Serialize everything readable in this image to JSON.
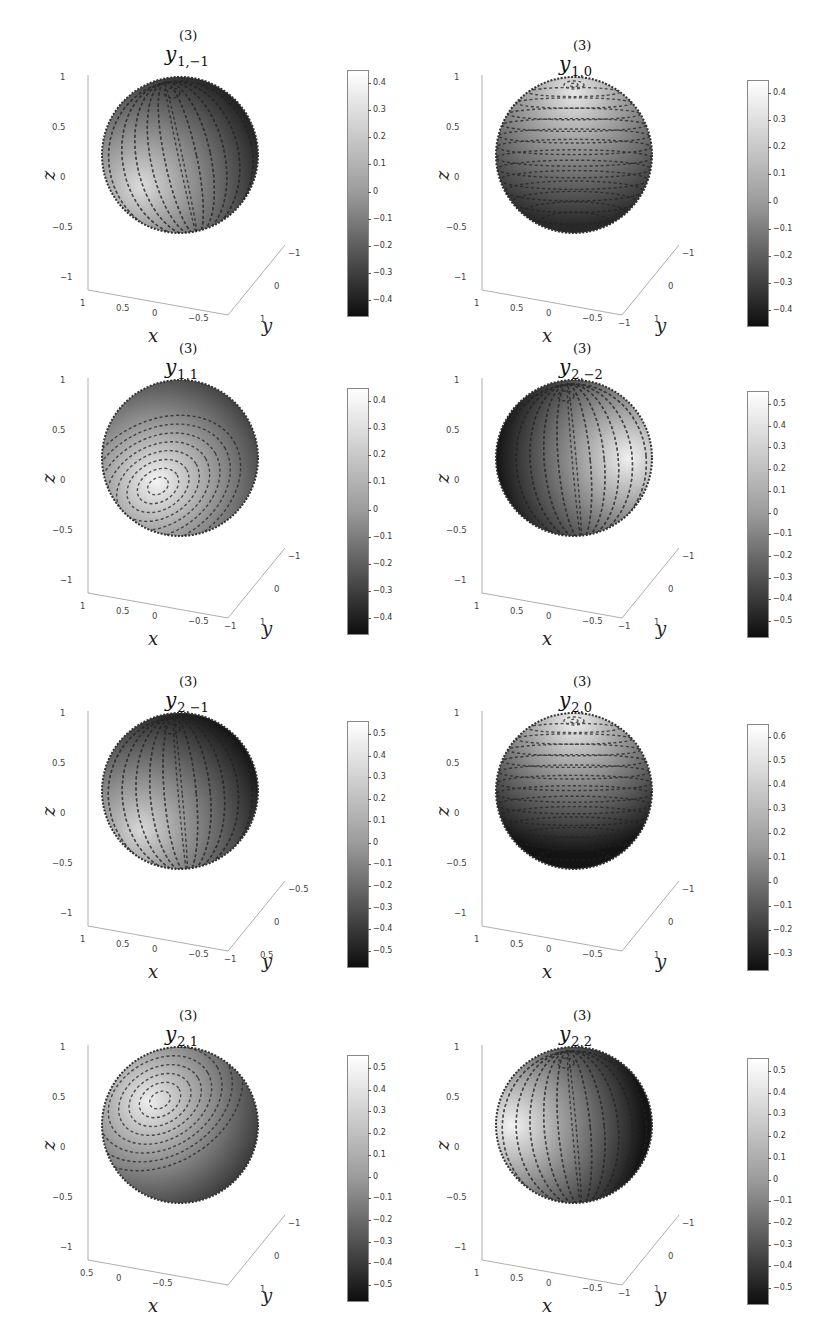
{
  "figure": {
    "superscript": "(3)",
    "symbol": "y",
    "axis_labels": {
      "x": "x",
      "y": "y",
      "z": "z"
    }
  },
  "chart_data": [
    {
      "type": "heatmap",
      "title": "y_{1,-1}^{(3)}",
      "subscript": "1,−1",
      "xlabel": "x",
      "ylabel": "y",
      "zlabel": "z",
      "z_ticks": [
        "1",
        "0.5",
        "0",
        "−0.5",
        "−1"
      ],
      "x_ticks": [
        "1",
        "0.5",
        "0",
        "−0.5"
      ],
      "y_ticks": [
        "−1",
        "0",
        "1"
      ],
      "colorbar": {
        "ticks": [
          "0.4",
          "0.3",
          "0.2",
          "0.1",
          "0",
          "−0.1",
          "−0.2",
          "−0.3",
          "−0.4"
        ],
        "range": [
          -0.48,
          0.48
        ]
      },
      "description": "sphere surface colored by field value with tangent vector field overlay; bright band lower-left, dark right half"
    },
    {
      "type": "heatmap",
      "title": "y_{1,0}^{(3)}",
      "subscript": "1,0",
      "xlabel": "x",
      "ylabel": "y",
      "zlabel": "z",
      "z_ticks": [
        "1",
        "0.5",
        "0",
        "−0.5",
        "−1"
      ],
      "x_ticks": [
        "1",
        "0.5",
        "0",
        "−0.5",
        "−1"
      ],
      "y_ticks": [
        "−1",
        "0",
        "1"
      ],
      "colorbar": {
        "ticks": [
          "0.4",
          "0.3",
          "0.2",
          "0.1",
          "0",
          "−0.1",
          "−0.2",
          "−0.3",
          "−0.4"
        ],
        "range": [
          -0.48,
          0.48
        ]
      },
      "description": "azimuthal circulating vector field, concentric circles at north pole; bright top, dark bottom"
    },
    {
      "type": "heatmap",
      "title": "y_{1,1}^{(3)}",
      "subscript": "1,1",
      "xlabel": "x",
      "ylabel": "y",
      "zlabel": "z",
      "z_ticks": [
        "1",
        "0.5",
        "0",
        "−0.5",
        "−1"
      ],
      "x_ticks": [
        "1",
        "0.5",
        "0",
        "−0.5",
        "−1"
      ],
      "y_ticks": [
        "−1",
        "0",
        "1"
      ],
      "colorbar": {
        "ticks": [
          "0.4",
          "0.3",
          "0.2",
          "0.1",
          "0",
          "−0.1",
          "−0.2",
          "−0.3",
          "−0.4"
        ],
        "range": [
          -0.48,
          0.48
        ]
      },
      "description": "vortex centered lower-left front; bright center, dark upper-right rim"
    },
    {
      "type": "heatmap",
      "title": "y_{2,-2}^{(3)}",
      "subscript": "2,−2",
      "xlabel": "x",
      "ylabel": "y",
      "zlabel": "z",
      "z_ticks": [
        "1",
        "0.5",
        "0",
        "−0.5",
        "−1"
      ],
      "x_ticks": [
        "1",
        "0.5",
        "0",
        "−0.5",
        "−1"
      ],
      "y_ticks": [
        "−1",
        "0",
        "1"
      ],
      "colorbar": {
        "ticks": [
          "0.5",
          "0.4",
          "0.3",
          "0.2",
          "0.1",
          "0",
          "−0.1",
          "−0.2",
          "−0.3",
          "−0.4",
          "−0.5"
        ],
        "range": [
          -0.55,
          0.55
        ]
      },
      "description": "dark lobe left-center, bright lobe right rim, meridional streamlines"
    },
    {
      "type": "heatmap",
      "title": "y_{2,-1}^{(3)}",
      "subscript": "2,−1",
      "xlabel": "x",
      "ylabel": "y",
      "zlabel": "z",
      "z_ticks": [
        "1",
        "0.5",
        "0",
        "−0.5",
        "−1"
      ],
      "x_ticks": [
        "1",
        "0.5",
        "0",
        "−0.5",
        "−1"
      ],
      "y_ticks": [
        "−0.5",
        "0",
        "0.5"
      ],
      "colorbar": {
        "ticks": [
          "0.5",
          "0.4",
          "0.3",
          "0.2",
          "0.1",
          "0",
          "−0.1",
          "−0.2",
          "−0.3",
          "−0.4",
          "−0.5"
        ],
        "range": [
          -0.55,
          0.55
        ]
      },
      "description": "dark upper-right lobe, bright lower-left, vortex near north pole"
    },
    {
      "type": "heatmap",
      "title": "y_{2,0}^{(3)}",
      "subscript": "2,0",
      "xlabel": "x",
      "ylabel": "y",
      "zlabel": "z",
      "z_ticks": [
        "1",
        "0.5",
        "0",
        "−0.5",
        "−1"
      ],
      "x_ticks": [
        "1",
        "0.5",
        "0",
        "−0.5"
      ],
      "y_ticks": [
        "−1",
        "0",
        "1"
      ],
      "colorbar": {
        "ticks": [
          "0.6",
          "0.5",
          "0.4",
          "0.3",
          "0.2",
          "0.1",
          "0",
          "−0.1",
          "−0.2",
          "−0.3"
        ],
        "range": [
          -0.32,
          0.63
        ]
      },
      "description": "concentric circles at north pole, bright cap, dark equatorial band"
    },
    {
      "type": "heatmap",
      "title": "y_{2,1}^{(3)}",
      "subscript": "2,1",
      "xlabel": "x",
      "ylabel": "y",
      "zlabel": "z",
      "z_ticks": [
        "1",
        "0.5",
        "0",
        "−0.5",
        "−1"
      ],
      "x_ticks": [
        "0.5",
        "0",
        "−0.5"
      ],
      "y_ticks": [
        "−1",
        "0",
        "1"
      ],
      "colorbar": {
        "ticks": [
          "0.5",
          "0.4",
          "0.3",
          "0.2",
          "0.1",
          "0",
          "−0.1",
          "−0.2",
          "−0.3",
          "−0.4",
          "−0.5"
        ],
        "range": [
          -0.55,
          0.55
        ]
      },
      "description": "bright vortex upper-left front, dark top and bottom"
    },
    {
      "type": "heatmap",
      "title": "y_{2,2}^{(3)}",
      "subscript": "2,2",
      "xlabel": "x",
      "ylabel": "y",
      "zlabel": "z",
      "z_ticks": [
        "1",
        "0.5",
        "0",
        "−0.5",
        "−1"
      ],
      "x_ticks": [
        "1",
        "0.5",
        "0",
        "−0.5",
        "−1"
      ],
      "y_ticks": [
        "−1",
        "0",
        "1"
      ],
      "colorbar": {
        "ticks": [
          "0.5",
          "0.4",
          "0.3",
          "0.2",
          "0.1",
          "0",
          "−0.1",
          "−0.2",
          "−0.3",
          "−0.4",
          "−0.5"
        ],
        "range": [
          -0.55,
          0.55
        ]
      },
      "description": "bright left rim lobe, dark right-center lobe, vortex near north pole"
    }
  ],
  "panels": [
    {
      "sub": "1,−1",
      "z": [
        "1",
        "0.5",
        "0",
        "−0.5",
        "−1"
      ],
      "x": [
        "1",
        "0.5",
        "0",
        "−0.5"
      ],
      "y": [
        "−1",
        "0",
        "1"
      ],
      "cb": [
        "0.4",
        "0.3",
        "0.2",
        "0.1",
        "0",
        "−0.1",
        "−0.2",
        "−0.3",
        "−0.4"
      ]
    },
    {
      "sub": "1,0",
      "z": [
        "1",
        "0.5",
        "0",
        "−0.5",
        "−1"
      ],
      "x": [
        "1",
        "0.5",
        "0",
        "−0.5",
        "−1"
      ],
      "y": [
        "−1",
        "0",
        "1"
      ],
      "cb": [
        "0.4",
        "0.3",
        "0.2",
        "0.1",
        "0",
        "−0.1",
        "−0.2",
        "−0.3",
        "−0.4"
      ]
    },
    {
      "sub": "1,1",
      "z": [
        "1",
        "0.5",
        "0",
        "−0.5",
        "−1"
      ],
      "x": [
        "1",
        "0.5",
        "0",
        "−0.5",
        "−1"
      ],
      "y": [
        "−1",
        "0",
        "1"
      ],
      "cb": [
        "0.4",
        "0.3",
        "0.2",
        "0.1",
        "0",
        "−0.1",
        "−0.2",
        "−0.3",
        "−0.4"
      ]
    },
    {
      "sub": "2,−2",
      "z": [
        "1",
        "0.5",
        "0",
        "−0.5",
        "−1"
      ],
      "x": [
        "1",
        "0.5",
        "0",
        "−0.5",
        "−1"
      ],
      "y": [
        "−1",
        "0",
        "1"
      ],
      "cb": [
        "0.5",
        "0.4",
        "0.3",
        "0.2",
        "0.1",
        "0",
        "−0.1",
        "−0.2",
        "−0.3",
        "−0.4",
        "−0.5"
      ]
    },
    {
      "sub": "2,−1",
      "z": [
        "1",
        "0.5",
        "0",
        "−0.5",
        "−1"
      ],
      "x": [
        "1",
        "0.5",
        "0",
        "−0.5",
        "−1"
      ],
      "y": [
        "−0.5",
        "0",
        "0.5"
      ],
      "cb": [
        "0.5",
        "0.4",
        "0.3",
        "0.2",
        "0.1",
        "0",
        "−0.1",
        "−0.2",
        "−0.3",
        "−0.4",
        "−0.5"
      ]
    },
    {
      "sub": "2,0",
      "z": [
        "1",
        "0.5",
        "0",
        "−0.5",
        "−1"
      ],
      "x": [
        "1",
        "0.5",
        "0",
        "−0.5"
      ],
      "y": [
        "−1",
        "0",
        "1"
      ],
      "cb": [
        "0.6",
        "0.5",
        "0.4",
        "0.3",
        "0.2",
        "0.1",
        "0",
        "−0.1",
        "−0.2",
        "−0.3"
      ]
    },
    {
      "sub": "2,1",
      "z": [
        "1",
        "0.5",
        "0",
        "−0.5",
        "−1"
      ],
      "x": [
        "0.5",
        "0",
        "−0.5"
      ],
      "y": [
        "−1",
        "0",
        "1"
      ],
      "cb": [
        "0.5",
        "0.4",
        "0.3",
        "0.2",
        "0.1",
        "0",
        "−0.1",
        "−0.2",
        "−0.3",
        "−0.4",
        "−0.5"
      ]
    },
    {
      "sub": "2,2",
      "z": [
        "1",
        "0.5",
        "0",
        "−0.5",
        "−1"
      ],
      "x": [
        "1",
        "0.5",
        "0",
        "−0.5",
        "−1"
      ],
      "y": [
        "−1",
        "0",
        "1"
      ],
      "cb": [
        "0.5",
        "0.4",
        "0.3",
        "0.2",
        "0.1",
        "0",
        "−0.1",
        "−0.2",
        "−0.3",
        "−0.4",
        "−0.5"
      ]
    }
  ]
}
